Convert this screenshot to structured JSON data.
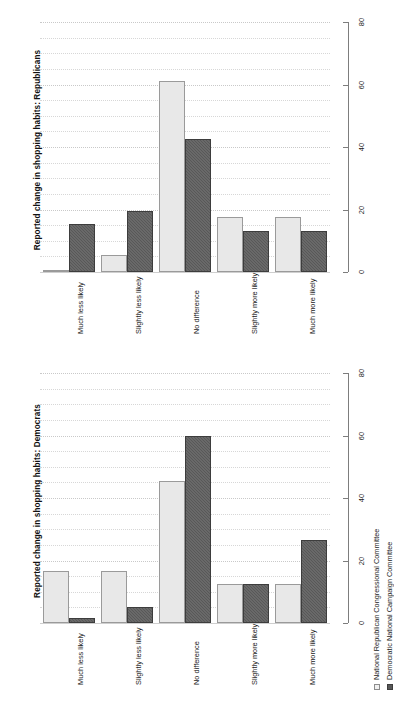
{
  "figure": {
    "panels": [
      {
        "id": "republicans",
        "axis_title": "Reported change in shopping habits: Republicans"
      },
      {
        "id": "democrats",
        "axis_title": "Reported change in shopping habits: Democrats"
      }
    ],
    "legend": {
      "entries": [
        {
          "label": "National Republican Congressional Committee",
          "swatch": "light"
        },
        {
          "label": "Democratic National Campaign Committee",
          "swatch": "dark"
        }
      ]
    },
    "colors": {
      "series_light": "#e8e8e8",
      "series_dark": "#585858",
      "axis": "#7d7d7d",
      "grid": "#d7d7d7",
      "text": "#1a1a1a",
      "background": "#ffffff"
    },
    "tick_labels": [
      "0",
      "20",
      "40",
      "60",
      "80"
    ]
  },
  "chart_data": [
    {
      "type": "bar",
      "title": "Reported change in shopping habits: Republicans",
      "xlabel": "",
      "ylabel": "Reported change in shopping habits: Republicans",
      "ylim": [
        0,
        80
      ],
      "yticks": [
        0,
        20,
        40,
        60,
        80
      ],
      "grid": true,
      "legend_position": "bottom-right",
      "orientation": "rotated-90",
      "categories": [
        "Much less likely",
        "Slightly less likely",
        "No difference",
        "Slightly more likely",
        "Much more likely"
      ],
      "series": [
        {
          "name": "National Republican Congressional Committee",
          "values": [
            0.8,
            5.5,
            61.0,
            17.5,
            17.5
          ]
        },
        {
          "name": "Democratic National Campaign Committee",
          "values": [
            15.5,
            19.5,
            42.5,
            13.0,
            13.0
          ]
        }
      ]
    },
    {
      "type": "bar",
      "title": "Reported change in shopping habits: Democrats",
      "xlabel": "",
      "ylabel": "Reported change in shopping habits: Democrats",
      "ylim": [
        0,
        80
      ],
      "yticks": [
        0,
        20,
        40,
        60,
        80
      ],
      "grid": true,
      "legend_position": "bottom-right",
      "orientation": "rotated-90",
      "categories": [
        "Much less likely",
        "Slightly less likely",
        "No difference",
        "Slightly more likely",
        "Much more likely"
      ],
      "series": [
        {
          "name": "National Republican Congressional Committee",
          "values": [
            16.5,
            16.5,
            45.5,
            12.5,
            12.5
          ]
        },
        {
          "name": "Democratic National Campaign Committee",
          "values": [
            1.6,
            5.2,
            60.0,
            12.5,
            26.5
          ]
        }
      ]
    }
  ]
}
